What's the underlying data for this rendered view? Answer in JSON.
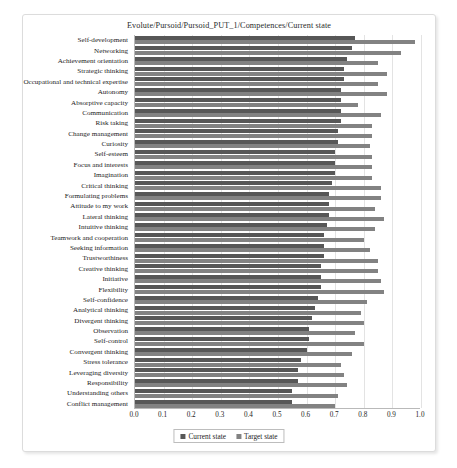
{
  "chart": {
    "title": "Evolute/Pursoid/Pursoid_PUT_1/Competences/Current state",
    "legend": {
      "current_label": "Current state",
      "target_label": "Target state",
      "position": "bottom-center"
    },
    "colors": {
      "current": "#575757",
      "target": "#828282",
      "grid": "#e3e3e3",
      "axis": "#b9b9b9",
      "card_background": "#ffffff"
    }
  },
  "chart_data": {
    "type": "bar",
    "orientation": "horizontal",
    "title": "Evolute/Pursoid/Pursoid_PUT_1/Competences/Current state",
    "xlabel": "",
    "ylabel": "",
    "xlim": [
      0.0,
      1.0
    ],
    "xticks": [
      "0.0",
      "0.1",
      "0.2",
      "0.3",
      "0.4",
      "0.5",
      "0.6",
      "0.7",
      "0.8",
      "0.9",
      "1.0"
    ],
    "grid": true,
    "legend_position": "bottom-center",
    "categories": [
      "Self-development",
      "Networking",
      "Achievement orientation",
      "Strategic thinking",
      "Occupational and technical expertise",
      "Autonomy",
      "Absorptive capacity",
      "Communication",
      "Risk taking",
      "Change management",
      "Curiosity",
      "Self-esteem",
      "Focus and interests",
      "Imagination",
      "Critical thinking",
      "Formulating problems",
      "Attitude to my work",
      "Lateral thinking",
      "Intuitive thinking",
      "Teamwork and cooperation",
      "Seeking information",
      "Trustworthiness",
      "Creative thinking",
      "Initiative",
      "Flexibility",
      "Self-confidence",
      "Analytical thinking",
      "Divergent thinking",
      "Observation",
      "Self-control",
      "Convergent thinking",
      "Stress tolerance",
      "Leveraging diversity",
      "Responsibility",
      "Understanding others",
      "Conflict management"
    ],
    "series": [
      {
        "name": "Current state",
        "values": [
          0.77,
          0.76,
          0.74,
          0.73,
          0.73,
          0.72,
          0.72,
          0.72,
          0.72,
          0.71,
          0.71,
          0.7,
          0.7,
          0.7,
          0.69,
          0.68,
          0.68,
          0.68,
          0.67,
          0.66,
          0.66,
          0.66,
          0.65,
          0.65,
          0.65,
          0.64,
          0.63,
          0.62,
          0.61,
          0.61,
          0.6,
          0.58,
          0.57,
          0.57,
          0.55,
          0.55
        ]
      },
      {
        "name": "Target state",
        "values": [
          0.98,
          0.93,
          0.85,
          0.88,
          0.85,
          0.88,
          0.78,
          0.86,
          0.83,
          0.83,
          0.82,
          0.83,
          0.83,
          0.83,
          0.86,
          0.86,
          0.84,
          0.87,
          0.84,
          0.8,
          0.82,
          0.85,
          0.85,
          0.86,
          0.87,
          0.81,
          0.79,
          0.8,
          0.77,
          0.8,
          0.76,
          0.72,
          0.73,
          0.74,
          0.71,
          0.7
        ]
      }
    ]
  }
}
